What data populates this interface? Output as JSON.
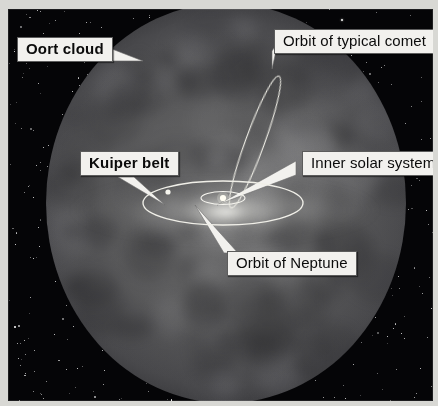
{
  "figure": {
    "background_color": "#050507",
    "border_color": "#d8d8d4",
    "label_box_color": "#f2f1ee",
    "label_text_color": "#0b0b0b",
    "orbit_line_color": "#f0efe8",
    "sphere_color": "#5d5d5f"
  },
  "labels": {
    "oort_cloud": "Oort cloud",
    "kuiper_belt": "Kuiper belt",
    "comet_orbit": "Orbit of typical comet",
    "inner_solar_system": "Inner solar system",
    "neptune_orbit": "Orbit of Neptune"
  },
  "objects": {
    "oort_cloud_sphere": "oort-cloud-sphere",
    "neptune_orbit_ellipse": "neptune-orbit-ellipse",
    "inner_system_ellipse": "inner-solar-system-ellipse",
    "comet_orbit_ellipse": "comet-orbit-ellipse",
    "sun": "sun-point",
    "kuiper_belt_object": "kuiper-belt-object",
    "starfield": "starfield"
  }
}
